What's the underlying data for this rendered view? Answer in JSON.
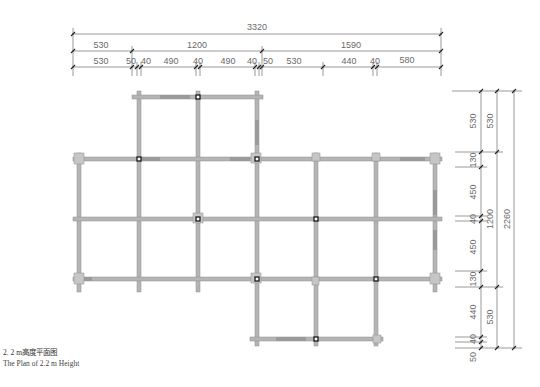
{
  "caption": {
    "chinese": "2. 2 m高度平面图",
    "english": "The Plan of 2.2 m Height"
  },
  "dimensions": {
    "top": {
      "overall": "3320",
      "level2": [
        "530",
        "1200",
        "1590"
      ],
      "level3": [
        "530",
        "50",
        "40",
        "490",
        "40",
        "490",
        "40",
        "50",
        "530",
        "440",
        "40",
        "580"
      ]
    },
    "right": {
      "overall": "2260",
      "level2": [
        "530",
        "1200",
        "530"
      ],
      "level3": [
        "530",
        "130",
        "450",
        "40",
        "450",
        "130",
        "440",
        "40",
        "50"
      ]
    }
  },
  "grid": {
    "columns_x": [
      79,
      139,
      198,
      257,
      316,
      376,
      435
    ],
    "rows_y": [
      97,
      159,
      219,
      279,
      339
    ]
  },
  "colors": {
    "beam": "#b4b4b4",
    "beam_edge": "#8c8c8c",
    "node": "#1a1a1a",
    "dim_line": "#555555"
  }
}
